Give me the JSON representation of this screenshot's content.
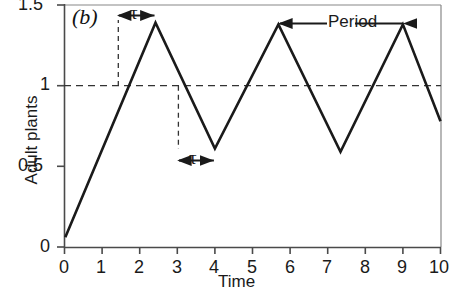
{
  "panel": {
    "label": "(b)"
  },
  "axes": {
    "ylabel": "Adult plants",
    "xlabel": "Time",
    "xticks": [
      "0",
      "1",
      "2",
      "3",
      "4",
      "5",
      "6",
      "7",
      "8",
      "9",
      "10"
    ],
    "yticks": [
      "0",
      "0.5",
      "1",
      "1.5"
    ]
  },
  "annotations": {
    "tau_top": "τ",
    "tau_bottom": "τ",
    "period": "Period"
  },
  "colors": {
    "line": "#1a1a1a",
    "axis": "#555555",
    "dashed": "#333333",
    "background": "#ffffff"
  },
  "chart_data": {
    "type": "line",
    "title": "",
    "subtitle": "(b)",
    "xlabel": "Time",
    "ylabel": "Adult plants",
    "xlim": [
      0,
      10
    ],
    "ylim": [
      0,
      1.5
    ],
    "xticks": [
      0,
      1,
      2,
      3,
      4,
      5,
      6,
      7,
      8,
      9,
      10
    ],
    "yticks": [
      0,
      0.5,
      1,
      1.5
    ],
    "grid": false,
    "legend": null,
    "series": [
      {
        "name": "Adult plants",
        "x": [
          0.02,
          2.42,
          4.0,
          5.69,
          7.34,
          9.0,
          10.0
        ],
        "y": [
          0.06,
          1.39,
          0.61,
          1.38,
          0.59,
          1.38,
          0.78
        ],
        "style": "solid",
        "description": "Oscillating sawtooth-like population trajectory with increasing rise to peaks near 1.38-1.39 and troughs near 0.59-0.61"
      }
    ],
    "reference_lines": [
      {
        "orientation": "horizontal",
        "value": 1.0,
        "style": "dashed",
        "label": "equilibrium"
      },
      {
        "orientation": "vertical",
        "value": 1.43,
        "style": "dashed",
        "from_y": 1.0,
        "to_y": 1.39
      },
      {
        "orientation": "vertical",
        "value": 3.03,
        "style": "dashed",
        "from_y": 0.61,
        "to_y": 1.0
      }
    ],
    "annotations": [
      {
        "text": "τ",
        "type": "double-arrow-horizontal",
        "x_from": 1.43,
        "x_to": 2.42,
        "y": 1.45
      },
      {
        "text": "τ",
        "type": "double-arrow-horizontal",
        "x_from": 3.03,
        "x_to": 4.0,
        "y": 0.52
      },
      {
        "text": "Period",
        "type": "double-arrow-horizontal",
        "x_from": 5.69,
        "x_to": 9.0,
        "y": 1.43
      }
    ]
  }
}
